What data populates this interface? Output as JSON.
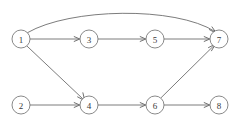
{
  "diagram": {
    "type": "directed-acyclic-graph",
    "background_color": "#ffffff",
    "node_stroke_color": "#6b6b6b",
    "node_fill_color": "#ffffff",
    "edge_stroke_color": "#5a5a5a",
    "label_color": "#3a3a3a",
    "node_radius": 9,
    "nodes": [
      {
        "id": "1",
        "label": "1",
        "cx": 21,
        "cy": 39
      },
      {
        "id": "2",
        "label": "2",
        "cx": 21,
        "cy": 105
      },
      {
        "id": "3",
        "label": "3",
        "cx": 89,
        "cy": 39
      },
      {
        "id": "4",
        "label": "4",
        "cx": 89,
        "cy": 105
      },
      {
        "id": "5",
        "label": "5",
        "cx": 155,
        "cy": 39
      },
      {
        "id": "6",
        "label": "6",
        "cx": 155,
        "cy": 105
      },
      {
        "id": "7",
        "label": "7",
        "cx": 219,
        "cy": 39
      },
      {
        "id": "8",
        "label": "8",
        "cx": 219,
        "cy": 105
      }
    ],
    "edges": [
      {
        "id": "e1-3",
        "from": "1",
        "to": "3",
        "shape": "straight",
        "path": "M 30.2,39 L 77.4,39",
        "arrow": "M 74.2,36.6 L 79.8,39 L 74.2,41.4"
      },
      {
        "id": "e3-5",
        "from": "3",
        "to": "5",
        "shape": "straight",
        "path": "M 98.2,39 L 143.4,39",
        "arrow": "M 140.2,36.6 L 145.8,39 L 140.2,41.4"
      },
      {
        "id": "e5-7",
        "from": "5",
        "to": "7",
        "shape": "straight",
        "path": "M 164.2,39 L 207.4,39",
        "arrow": "M 204.2,36.6 L 209.8,39 L 204.2,41.4"
      },
      {
        "id": "e1-7",
        "from": "1",
        "to": "7",
        "shape": "curved",
        "path": "M 27.6,32.6 C 70,8 175,6 215.0,31.5",
        "arrow": "M 209.4,29.6 L 216.6,33.5 L 212.0,26.9"
      },
      {
        "id": "e1-4",
        "from": "1",
        "to": "4",
        "shape": "straight",
        "path": "M 26.9,46.0 L 82.6,98.6",
        "arrow": "M 82.9,92.8 L 84.8,100.7 L 77.6,96.9"
      },
      {
        "id": "e2-4",
        "from": "2",
        "to": "4",
        "shape": "straight",
        "path": "M 30.2,105 L 77.4,105",
        "arrow": "M 74.2,102.6 L 79.8,105 L 74.2,107.4"
      },
      {
        "id": "e4-6",
        "from": "4",
        "to": "6",
        "shape": "straight",
        "path": "M 98.2,105 L 143.4,105",
        "arrow": "M 140.2,102.6 L 145.8,105 L 140.2,107.4"
      },
      {
        "id": "e6-8",
        "from": "6",
        "to": "8",
        "shape": "straight",
        "path": "M 164.2,105 L 207.4,105",
        "arrow": "M 204.2,102.6 L 209.8,105 L 204.2,107.4"
      },
      {
        "id": "e6-7",
        "from": "6",
        "to": "7",
        "shape": "straight",
        "path": "M 161.3,97.5 L 213.2,46.3",
        "arrow": "M 208.5,47.6 L 215.5,44.0 L 211.5,50.8"
      }
    ]
  }
}
